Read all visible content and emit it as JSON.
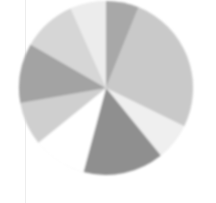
{
  "figure": {
    "background_color": "#ffffff",
    "page_fold_color": "#ededed",
    "title": "",
    "caption": ""
  },
  "chart_data": {
    "type": "pie",
    "title": "",
    "subtitle": "",
    "xlabel": "",
    "ylabel": "",
    "legend_position": "none",
    "grid": false,
    "center_x": 106,
    "center_y": 88,
    "radius": 87,
    "start_angle_deg": -90,
    "direction": "clockwise",
    "categories": [
      "Segment 1",
      "Segment 2",
      "Segment 3",
      "Segment 4",
      "Segment 5",
      "Segment 6",
      "Segment 7",
      "Segment 8",
      "Segment 9"
    ],
    "values": [
      6,
      26,
      7,
      15,
      10,
      8,
      11,
      10,
      7
    ],
    "percentages": [
      6,
      26,
      7,
      15,
      10,
      8,
      11,
      10,
      7
    ],
    "colors": [
      "#a8a8a8",
      "#c9c9c9",
      "#efefef",
      "#8f8f8f",
      "#ffffff",
      "#cfcfcf",
      "#a3a3a3",
      "#d6d6d6",
      "#ececec"
    ],
    "slices": [
      {
        "label": "Segment 1",
        "value": 6,
        "percent": 6,
        "color": "#a8a8a8",
        "start_deg": -90,
        "end_deg": -68
      },
      {
        "label": "Segment 2",
        "value": 26,
        "percent": 26,
        "color": "#c9c9c9",
        "start_deg": -68,
        "end_deg": 26
      },
      {
        "label": "Segment 3",
        "value": 7,
        "percent": 7,
        "color": "#efefef",
        "start_deg": 26,
        "end_deg": 51
      },
      {
        "label": "Segment 4",
        "value": 15,
        "percent": 15,
        "color": "#8f8f8f",
        "start_deg": 51,
        "end_deg": 105
      },
      {
        "label": "Segment 5",
        "value": 10,
        "percent": 10,
        "color": "#ffffff",
        "start_deg": 105,
        "end_deg": 141
      },
      {
        "label": "Segment 6",
        "value": 8,
        "percent": 8,
        "color": "#cfcfcf",
        "start_deg": 141,
        "end_deg": 170
      },
      {
        "label": "Segment 7",
        "value": 11,
        "percent": 11,
        "color": "#a3a3a3",
        "start_deg": 170,
        "end_deg": 210
      },
      {
        "label": "Segment 8",
        "value": 10,
        "percent": 10,
        "color": "#d6d6d6",
        "start_deg": 210,
        "end_deg": 246
      },
      {
        "label": "Segment 9",
        "value": 7,
        "percent": 7,
        "color": "#ececec",
        "start_deg": 246,
        "end_deg": 270
      }
    ]
  }
}
